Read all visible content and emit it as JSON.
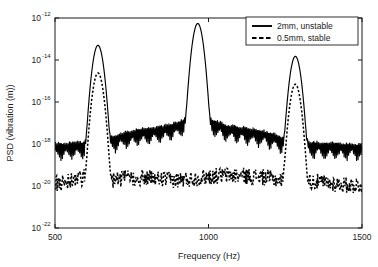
{
  "chart_data": {
    "type": "line",
    "title": "",
    "xlabel": "Frequency (Hz)",
    "ylabel": "PSD (vibration (m))",
    "xlim": [
      500,
      1500
    ],
    "ylim": [
      1e-22,
      1e-12
    ],
    "yscale": "log",
    "xscale": "linear",
    "grid": false,
    "xticks": [
      500,
      1000,
      1500
    ],
    "xtick_labels": [
      "500",
      "1000",
      "1500"
    ],
    "yticks": [
      1e-12,
      1e-14,
      1e-16,
      1e-18,
      1e-20,
      1e-22
    ],
    "ytick_labels": [
      "10-12",
      "10-14",
      "10-16",
      "10-18",
      "10-20",
      "10-22"
    ],
    "ytick_mantissa": [
      "10",
      "10",
      "10",
      "10",
      "10",
      "10"
    ],
    "ytick_exponents": [
      "-12",
      "-14",
      "-16",
      "-18",
      "-20",
      "-22"
    ],
    "legend_position": "upper right",
    "series": [
      {
        "name": "2mm, unstable",
        "style": "solid",
        "color": "#000000",
        "noise_floor": 1e-18,
        "sidelobe_level": 8e-18,
        "peaks": [
          {
            "frequency": 640,
            "value": 5e-14
          },
          {
            "frequency": 965,
            "value": 5.5e-13
          },
          {
            "frequency": 1283,
            "value": 1.5e-14
          }
        ]
      },
      {
        "name": "0.5mm, stable",
        "style": "dashed",
        "color": "#000000",
        "noise_floor": 1e-20,
        "sidelobe_level": 4e-20,
        "peaks": [
          {
            "frequency": 640,
            "value": 2.4e-15
          },
          {
            "frequency": 1283,
            "value": 7e-16
          }
        ]
      }
    ],
    "annotations": []
  },
  "legend": {
    "entries": [
      {
        "label": "2mm, unstable",
        "style": "solid"
      },
      {
        "label": "0.5mm, stable",
        "style": "dashed"
      }
    ]
  },
  "axes": {
    "x_title": "Frequency (Hz)",
    "y_title": "PSD (vibration (m))"
  }
}
